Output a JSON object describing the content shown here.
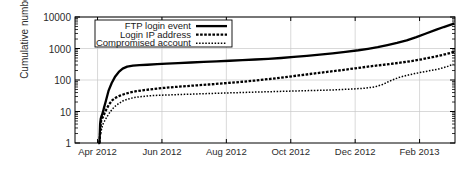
{
  "chart_data": {
    "type": "line",
    "title": "",
    "xlabel": "",
    "ylabel": "Cumulative number",
    "yscale": "log",
    "ylim": [
      1,
      10000
    ],
    "yticks": [
      "1",
      "10",
      "100",
      "1000",
      "10000"
    ],
    "ytick_values": [
      1,
      10,
      100,
      1000,
      10000
    ],
    "xticks": [
      "Apr 2012",
      "Jun 2012",
      "Aug 2012",
      "Oct 2012",
      "Dec 2012",
      "Feb 2013"
    ],
    "xtick_months": [
      3,
      5,
      7,
      9,
      11,
      13
    ],
    "xlim_months": [
      2.3,
      14.1
    ],
    "grid": true,
    "legend_position": "top-center",
    "series": [
      {
        "name": "FTP login event",
        "style": "solid",
        "points": [
          [
            3.02,
            1
          ],
          [
            3.06,
            1
          ],
          [
            3.08,
            4
          ],
          [
            3.1,
            6
          ],
          [
            3.12,
            7
          ],
          [
            3.16,
            9
          ],
          [
            3.2,
            13
          ],
          [
            3.26,
            22
          ],
          [
            3.34,
            45
          ],
          [
            3.44,
            80
          ],
          [
            3.55,
            130
          ],
          [
            3.66,
            180
          ],
          [
            3.78,
            230
          ],
          [
            3.92,
            265
          ],
          [
            4.1,
            285
          ],
          [
            4.3,
            295
          ],
          [
            4.55,
            305
          ],
          [
            4.85,
            318
          ],
          [
            5.15,
            330
          ],
          [
            5.5,
            345
          ],
          [
            5.9,
            360
          ],
          [
            6.3,
            375
          ],
          [
            6.7,
            390
          ],
          [
            7.1,
            408
          ],
          [
            7.5,
            425
          ],
          [
            7.9,
            448
          ],
          [
            8.3,
            470
          ],
          [
            8.7,
            500
          ],
          [
            9.1,
            540
          ],
          [
            9.5,
            585
          ],
          [
            9.9,
            640
          ],
          [
            10.3,
            700
          ],
          [
            10.7,
            780
          ],
          [
            11.1,
            880
          ],
          [
            11.4,
            980
          ],
          [
            11.7,
            1100
          ],
          [
            12.0,
            1280
          ],
          [
            12.3,
            1500
          ],
          [
            12.6,
            1800
          ],
          [
            12.9,
            2300
          ],
          [
            13.2,
            3000
          ],
          [
            13.5,
            3900
          ],
          [
            13.75,
            4800
          ],
          [
            13.95,
            5600
          ],
          [
            14.08,
            6200
          ]
        ]
      },
      {
        "name": "Login IP address",
        "style": "dashed",
        "points": [
          [
            3.06,
            1
          ],
          [
            3.09,
            3
          ],
          [
            3.11,
            5
          ],
          [
            3.14,
            6
          ],
          [
            3.18,
            7
          ],
          [
            3.22,
            9
          ],
          [
            3.28,
            12
          ],
          [
            3.36,
            17
          ],
          [
            3.46,
            23
          ],
          [
            3.58,
            28
          ],
          [
            3.7,
            32
          ],
          [
            3.84,
            36
          ],
          [
            4.0,
            40
          ],
          [
            4.2,
            44
          ],
          [
            4.45,
            48
          ],
          [
            4.75,
            52
          ],
          [
            5.05,
            56
          ],
          [
            5.4,
            60
          ],
          [
            5.75,
            64
          ],
          [
            6.1,
            68
          ],
          [
            6.45,
            72
          ],
          [
            6.8,
            77
          ],
          [
            7.15,
            82
          ],
          [
            7.5,
            88
          ],
          [
            7.85,
            95
          ],
          [
            8.2,
            104
          ],
          [
            8.55,
            114
          ],
          [
            8.9,
            126
          ],
          [
            9.25,
            140
          ],
          [
            9.6,
            155
          ],
          [
            9.95,
            172
          ],
          [
            10.3,
            190
          ],
          [
            10.65,
            210
          ],
          [
            11.0,
            235
          ],
          [
            11.35,
            262
          ],
          [
            11.7,
            290
          ],
          [
            12.05,
            320
          ],
          [
            12.4,
            355
          ],
          [
            12.75,
            400
          ],
          [
            13.1,
            460
          ],
          [
            13.4,
            530
          ],
          [
            13.7,
            620
          ],
          [
            13.95,
            720
          ],
          [
            14.08,
            800
          ]
        ]
      },
      {
        "name": "Compromised account",
        "style": "dotted",
        "points": [
          [
            3.1,
            2
          ],
          [
            3.13,
            3
          ],
          [
            3.17,
            4
          ],
          [
            3.22,
            5
          ],
          [
            3.3,
            7
          ],
          [
            3.4,
            10
          ],
          [
            3.52,
            14
          ],
          [
            3.66,
            18
          ],
          [
            3.8,
            22
          ],
          [
            3.96,
            25
          ],
          [
            4.15,
            28
          ],
          [
            4.4,
            30
          ],
          [
            4.7,
            32
          ],
          [
            5.0,
            33
          ],
          [
            5.35,
            34
          ],
          [
            5.7,
            35
          ],
          [
            6.05,
            36
          ],
          [
            6.4,
            37
          ],
          [
            6.75,
            38
          ],
          [
            7.1,
            39
          ],
          [
            7.45,
            40
          ],
          [
            7.8,
            41
          ],
          [
            8.15,
            42
          ],
          [
            8.5,
            43
          ],
          [
            8.85,
            44
          ],
          [
            9.2,
            45
          ],
          [
            9.55,
            46
          ],
          [
            9.9,
            47
          ],
          [
            10.25,
            48
          ],
          [
            10.6,
            50
          ],
          [
            10.95,
            52
          ],
          [
            11.3,
            55
          ],
          [
            11.6,
            60
          ],
          [
            11.85,
            72
          ],
          [
            12.1,
            95
          ],
          [
            12.35,
            120
          ],
          [
            12.6,
            140
          ],
          [
            12.85,
            160
          ],
          [
            13.1,
            180
          ],
          [
            13.35,
            200
          ],
          [
            13.6,
            225
          ],
          [
            13.85,
            265
          ],
          [
            14.05,
            320
          ]
        ]
      }
    ]
  },
  "legend": {
    "items": [
      {
        "label": "FTP login event",
        "style": "solid"
      },
      {
        "label": "Login IP address",
        "style": "dashed"
      },
      {
        "label": "Compromised account",
        "style": "dotted"
      }
    ]
  },
  "colors": {
    "line": "#000000",
    "axis": "#000000",
    "grid": "#c8c8c8",
    "text": "#2b2b2b",
    "background": "#ffffff"
  }
}
